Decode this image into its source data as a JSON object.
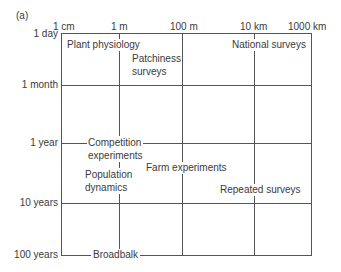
{
  "panel_label": "(a)",
  "x_axis": {
    "ticks": [
      {
        "label": "1 cm",
        "x": 61
      },
      {
        "label": "1 m",
        "x": 119
      },
      {
        "label": "100 m",
        "x": 182
      },
      {
        "label": "10 km",
        "x": 254
      },
      {
        "label": "1000 km",
        "x": 311
      }
    ]
  },
  "y_axis": {
    "ticks": [
      {
        "label": "1 day",
        "y": 33
      },
      {
        "label": "1 month",
        "y": 85
      },
      {
        "label": "1 year",
        "y": 143
      },
      {
        "label": "10 years",
        "y": 203
      },
      {
        "label": "100 years",
        "y": 255
      }
    ]
  },
  "regions": [
    {
      "label": "Plant physiology"
    },
    {
      "label": "Patchiness",
      "label2": "surveys"
    },
    {
      "label": "National surveys"
    },
    {
      "label": "Competition",
      "label2": "experiments"
    },
    {
      "label": "Population",
      "label2": "dynamics"
    },
    {
      "label": "Farm experiments"
    },
    {
      "label": "Repeated surveys"
    },
    {
      "label": "Broadbalk"
    }
  ]
}
